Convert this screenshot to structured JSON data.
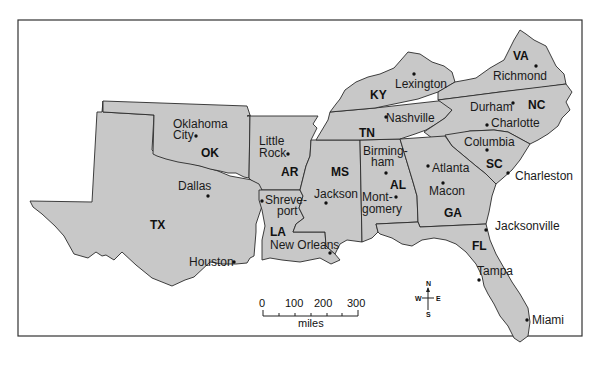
{
  "map": {
    "title": "Southeastern United States",
    "states": [
      {
        "abbr": "TX",
        "x": 150,
        "y": 229
      },
      {
        "abbr": "OK",
        "x": 201,
        "y": 153
      },
      {
        "abbr": "AR",
        "x": 281,
        "y": 172
      },
      {
        "abbr": "LA",
        "x": 270,
        "y": 232
      },
      {
        "abbr": "MS",
        "x": 331,
        "y": 173
      },
      {
        "abbr": "AL",
        "x": 390,
        "y": 187
      },
      {
        "abbr": "TN",
        "x": 359,
        "y": 134
      },
      {
        "abbr": "KY",
        "x": 371,
        "y": 96
      },
      {
        "abbr": "GA",
        "x": 444,
        "y": 215
      },
      {
        "abbr": "FL",
        "x": 473,
        "y": 248
      },
      {
        "abbr": "SC",
        "x": 486,
        "y": 166
      },
      {
        "abbr": "NC",
        "x": 527,
        "y": 109
      },
      {
        "abbr": "VA",
        "x": 514,
        "y": 58
      }
    ],
    "cities": [
      {
        "name": "Oklahoma",
        "line2": "City",
        "x": 173,
        "y": 128
      },
      {
        "name": "Dallas",
        "x": 178,
        "y": 190
      },
      {
        "name": "Houston",
        "x": 189,
        "y": 262
      },
      {
        "name": "Little",
        "line2": "Rock",
        "x": 259,
        "y": 145
      },
      {
        "name": "Shreve-",
        "line2": "port",
        "x": 264,
        "y": 204
      },
      {
        "name": "New Orleans",
        "x": 270,
        "y": 247
      },
      {
        "name": "Jackson",
        "x": 314,
        "y": 196
      },
      {
        "name": "Birming-",
        "line2": "ham",
        "x": 362,
        "y": 156
      },
      {
        "name": "Mont-",
        "line2": "gomery",
        "x": 362,
        "y": 198
      },
      {
        "name": "Atlanta",
        "x": 432,
        "y": 172
      },
      {
        "name": "Macon",
        "x": 429,
        "y": 195
      },
      {
        "name": "Nashville",
        "x": 385,
        "y": 121
      },
      {
        "name": "Lexington",
        "x": 394,
        "y": 88
      },
      {
        "name": "Richmond",
        "x": 493,
        "y": 79
      },
      {
        "name": "Durham",
        "x": 470,
        "y": 110
      },
      {
        "name": "Charlotte",
        "x": 491,
        "y": 126
      },
      {
        "name": "Columbia",
        "x": 464,
        "y": 146
      },
      {
        "name": "Charleston",
        "x": 515,
        "y": 180
      },
      {
        "name": "Jacksonville",
        "x": 495,
        "y": 230
      },
      {
        "name": "Tampa",
        "x": 477,
        "y": 274
      },
      {
        "name": "Miami",
        "x": 532,
        "y": 323
      }
    ],
    "scale": {
      "ticks": [
        "0",
        "100",
        "200",
        "300"
      ],
      "unit": "miles"
    },
    "compass": {
      "n": "N",
      "s": "S",
      "e": "E",
      "w": "W"
    }
  }
}
